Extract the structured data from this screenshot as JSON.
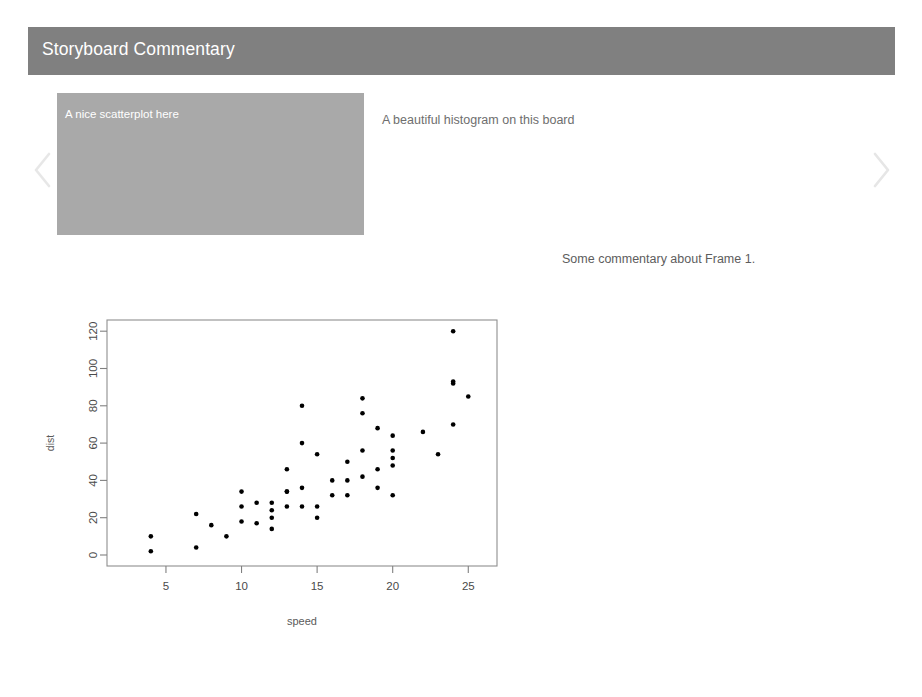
{
  "header": {
    "title": "Storyboard Commentary",
    "background_color": "#808080",
    "text_color": "#ffffff"
  },
  "carousel": {
    "prev_icon": "chevron-left-icon",
    "next_icon": "chevron-right-icon",
    "prev_label": "",
    "next_label": ""
  },
  "frames": {
    "active_index": 0,
    "items": [
      {
        "label": "A nice scatterplot here",
        "state": "active",
        "background_color": "#a9a9a9",
        "text_color": "#ffffff"
      },
      {
        "label": "A beautiful histogram on this board",
        "state": "inactive",
        "background_color": "#ffffff",
        "text_color": "#6e6e6e"
      }
    ],
    "commentary": "Some commentary about Frame 1."
  },
  "footer": {
    "artifact_text": ""
  },
  "chart_data": {
    "type": "scatter",
    "title": "",
    "subtitle": "",
    "xlabel": "speed",
    "ylabel": "dist",
    "xlim": [
      1.1,
      26.9
    ],
    "ylim": [
      -5.9,
      126
    ],
    "xticks": [
      5,
      10,
      15,
      20,
      25
    ],
    "yticks": [
      0,
      20,
      40,
      60,
      80,
      100,
      120
    ],
    "grid": false,
    "legend": null,
    "point_color": "#000000",
    "point_size": 2.3,
    "axis_color": "#808080",
    "x": [
      4,
      4,
      7,
      7,
      8,
      9,
      10,
      10,
      10,
      11,
      11,
      12,
      12,
      12,
      12,
      13,
      13,
      13,
      13,
      14,
      14,
      14,
      14,
      15,
      15,
      15,
      16,
      16,
      17,
      17,
      17,
      18,
      18,
      18,
      18,
      19,
      19,
      19,
      20,
      20,
      20,
      20,
      20,
      22,
      23,
      24,
      24,
      24,
      24,
      25
    ],
    "y": [
      2,
      10,
      4,
      22,
      16,
      10,
      18,
      26,
      34,
      17,
      28,
      14,
      20,
      24,
      28,
      26,
      34,
      34,
      46,
      26,
      36,
      60,
      80,
      20,
      26,
      54,
      32,
      40,
      32,
      40,
      50,
      42,
      56,
      76,
      84,
      36,
      46,
      68,
      32,
      48,
      52,
      56,
      64,
      66,
      54,
      70,
      92,
      93,
      120,
      85
    ],
    "series": [
      {
        "name": "cars",
        "x": [
          4,
          4,
          7,
          7,
          8,
          9,
          10,
          10,
          10,
          11,
          11,
          12,
          12,
          12,
          12,
          13,
          13,
          13,
          13,
          14,
          14,
          14,
          14,
          15,
          15,
          15,
          16,
          16,
          17,
          17,
          17,
          18,
          18,
          18,
          18,
          19,
          19,
          19,
          20,
          20,
          20,
          20,
          20,
          22,
          23,
          24,
          24,
          24,
          24,
          25
        ],
        "values": [
          2,
          10,
          4,
          22,
          16,
          10,
          18,
          26,
          34,
          17,
          28,
          14,
          20,
          24,
          28,
          26,
          34,
          34,
          46,
          26,
          36,
          60,
          80,
          20,
          26,
          54,
          32,
          40,
          32,
          40,
          50,
          42,
          56,
          76,
          84,
          36,
          46,
          68,
          32,
          48,
          52,
          56,
          64,
          66,
          54,
          70,
          92,
          93,
          120,
          85
        ]
      }
    ]
  }
}
